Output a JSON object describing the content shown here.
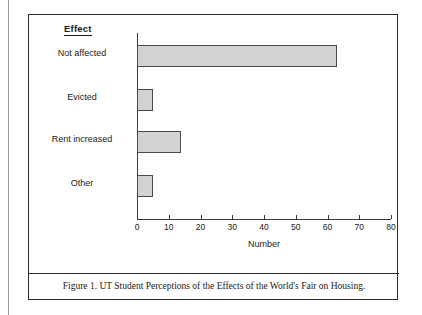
{
  "figure": {
    "caption": "Figure 1. UT Student Perceptions of the Effects of the World's Fair on Housing.",
    "category_heading": "Effect",
    "border_color": "#2b2b2b"
  },
  "chart_data": {
    "type": "bar",
    "orientation": "horizontal",
    "title": "",
    "xlabel": "Number",
    "ylabel": "Effect",
    "categories": [
      "Not affected",
      "Evicted",
      "Rent increased",
      "Other"
    ],
    "values": [
      63,
      5,
      14,
      5
    ],
    "xlim": [
      0,
      80
    ],
    "xticks": [
      0,
      10,
      20,
      30,
      40,
      50,
      60,
      70,
      80
    ],
    "xtick_labels": [
      "0",
      "10",
      "20",
      "30",
      "40",
      "50",
      "60",
      "70",
      "80"
    ],
    "grid": false,
    "legend": false,
    "bar_fill_color": "#d2d2d2",
    "bar_edge_color": "#4a4a4a",
    "axis_color": "#3a3a3a"
  }
}
